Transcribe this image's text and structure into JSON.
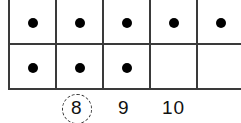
{
  "figure": {
    "type": "ten-frame",
    "rows": 2,
    "columns_visible": 5,
    "filled": [
      [
        true,
        true,
        true,
        true,
        true
      ],
      [
        true,
        true,
        true,
        false,
        false
      ]
    ],
    "dot_count": 8
  },
  "number_choices": [
    {
      "label": "8",
      "circled": true
    },
    {
      "label": "9",
      "circled": false
    },
    {
      "label": "10",
      "circled": false
    }
  ],
  "colors": {
    "line": "#3a3a3a",
    "dot": "#000000"
  }
}
